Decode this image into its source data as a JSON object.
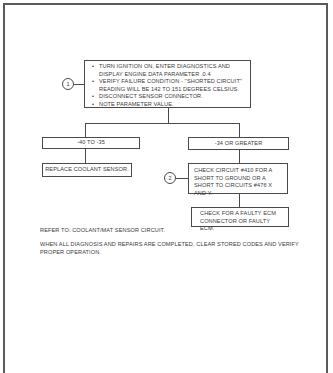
{
  "diagram": {
    "step1": {
      "marker": "1",
      "bullets": [
        "TURN IGNITION ON, ENTER DIAGNOSTICS AND DISPLAY ENGINE DATA PARAMETER .0.4",
        "VERIFY FAILURE CONDITION - ''SHORTED CIRCUIT'' READING WILL BE 142 TO 151 DEGREES CELSIUS.",
        "DISCONNECT SENSOR CONNECTOR.",
        "NOTE PARAMETER VALUE."
      ]
    },
    "branch_left": {
      "condition": "-40 TO -35",
      "action": "REPLACE COOLANT SENSOR."
    },
    "branch_right": {
      "condition": "-34 OR GREATER",
      "step2": {
        "marker": "2",
        "text": "CHECK CIRCUIT #410 FOR A SHORT TO GROUND OR A SHORT TO CIRCUITS #476 X AND Y."
      },
      "action": "CHECK FOR A FAULTY ECM CONNECTOR OR FAULTY ECM."
    },
    "notes": {
      "refer": "REFER TO: COOLANT/MAT SENSOR CIRCUIT.",
      "completion": "WHEN ALL DIAGNOSIS AND REPAIRS ARE COMPLETED, CLEAR STORED CODES AND VERIFY PROPER OPERATION."
    }
  }
}
